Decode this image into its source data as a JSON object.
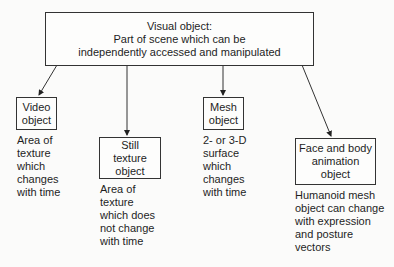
{
  "root": {
    "title": "Visual object:",
    "line2": "Part of scene which can be",
    "line3": "independently accessed and manipulated"
  },
  "children": [
    {
      "label_line1": "Video",
      "label_line2": "object",
      "label_line3": "",
      "description": "Area of\ntexture\nwhich\nchanges\nwith time"
    },
    {
      "label_line1": "Still",
      "label_line2": "texture",
      "label_line3": "object",
      "description": "Area of\ntexture\nwhich does\nnot change\nwith time"
    },
    {
      "label_line1": "Mesh",
      "label_line2": "object",
      "label_line3": "",
      "description": "2- or 3-D\nsurface\nwhich\nchanges\nwith time"
    },
    {
      "label_line1": "Face and body",
      "label_line2": "animation",
      "label_line3": "object",
      "description": "Humanoid mesh\nobject can change\nwith expression\nand posture\nvectors"
    }
  ],
  "colors": {
    "line": "#333333",
    "background": "#fbfbfa"
  }
}
